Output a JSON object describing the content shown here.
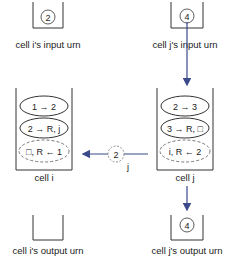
{
  "colors": {
    "arrow": "#3a4a8a",
    "stroke": "#333333"
  },
  "input_urns": [
    {
      "label": "cell i's input urn",
      "ball": "2"
    },
    {
      "label": "cell j's input urn",
      "ball": "4"
    }
  ],
  "cells": [
    {
      "label": "cell i",
      "rules": [
        "1 → 2",
        "2 → R, j",
        "□, R ← 1"
      ]
    },
    {
      "label": "cell j",
      "rules": [
        "2 → 3",
        "3 → R, □",
        "i, R ← 2"
      ]
    }
  ],
  "message": {
    "ball": "2",
    "target": "j"
  },
  "output_urns": [
    {
      "label": "cell i's output urn",
      "ball": ""
    },
    {
      "label": "cell j's output urn",
      "ball": "4"
    }
  ]
}
